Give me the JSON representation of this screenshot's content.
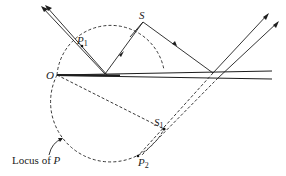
{
  "diagram": {
    "type": "thin-film interference geometry",
    "labels": {
      "source": "S",
      "origin": "O",
      "p1_main": "P",
      "p1_sub": "1",
      "p2_main": "P",
      "p2_sub": "2",
      "s1_main": "S",
      "s1_sub": "1",
      "locus_text": "Locus of ",
      "locus_var": "P"
    },
    "points": {
      "S": [
        143,
        22
      ],
      "O": [
        57,
        75
      ],
      "P1": [
        82,
        46
      ],
      "S1": [
        164,
        129
      ],
      "P2": [
        138,
        156
      ],
      "reflect_top": [
        105,
        75
      ],
      "reflect_bottom": [
        213,
        74
      ]
    },
    "colors": {
      "line": "#1e1e1e",
      "background": "#ffffff"
    }
  }
}
